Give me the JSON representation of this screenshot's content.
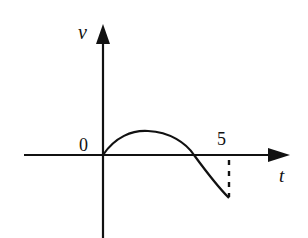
{
  "diagram": {
    "title": "",
    "type": "velocity-time graph",
    "axes": {
      "y_label": "v",
      "x_label": "t",
      "origin_label": "0",
      "x_tick_label": "5"
    },
    "curve": {
      "description": "velocity rises from 0 to a positive maximum, returns to 0 before t=5, then becomes negative until t=5",
      "start": [
        0,
        0
      ],
      "end_t": 5
    },
    "colors": {
      "ink": "#111111",
      "background": "#ffffff"
    }
  }
}
